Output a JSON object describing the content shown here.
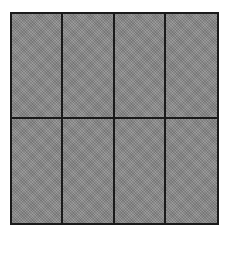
{
  "diagram": {
    "type": "partitioned-square",
    "columns": 4,
    "rows": 2,
    "total_parts": 8,
    "shaded_parts": 8,
    "colors": {
      "fill": "#8e8e8e",
      "line": "#1a1a1a",
      "background": "#ffffff"
    },
    "cells": [
      {
        "row": 0,
        "col": 0,
        "shaded": true
      },
      {
        "row": 0,
        "col": 1,
        "shaded": true
      },
      {
        "row": 0,
        "col": 2,
        "shaded": true
      },
      {
        "row": 0,
        "col": 3,
        "shaded": true
      },
      {
        "row": 1,
        "col": 0,
        "shaded": true
      },
      {
        "row": 1,
        "col": 1,
        "shaded": true
      },
      {
        "row": 1,
        "col": 2,
        "shaded": true
      },
      {
        "row": 1,
        "col": 3,
        "shaded": true
      }
    ]
  }
}
